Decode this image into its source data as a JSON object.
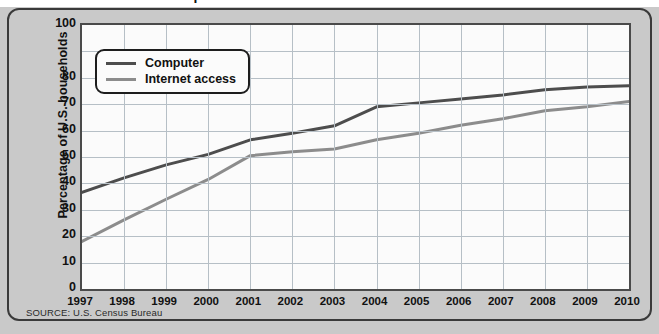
{
  "title_sliver": "Computer and Internet Access in U.S. Households",
  "axis": {
    "ylabel": "Percentage of U.S. households",
    "yticks": [
      {
        "value": 100,
        "label": "100"
      },
      {
        "value": 90,
        "label": ""
      },
      {
        "value": 80,
        "label": "80"
      },
      {
        "value": 70,
        "label": "70"
      },
      {
        "value": 60,
        "label": "60"
      },
      {
        "value": 50,
        "label": "50"
      },
      {
        "value": 40,
        "label": "40"
      },
      {
        "value": 30,
        "label": "30"
      },
      {
        "value": 20,
        "label": "20"
      },
      {
        "value": 10,
        "label": "10"
      },
      {
        "value": 0,
        "label": "0"
      }
    ],
    "xlabel": ""
  },
  "legend": {
    "position": "top-left-inside",
    "items": [
      {
        "label": "Computer",
        "color": "#4d4d4d"
      },
      {
        "label": "Internet access",
        "color": "#8c8c8c"
      }
    ]
  },
  "source": {
    "text": "SOURCE: U.S. Census Bureau"
  },
  "colors": {
    "background": "#c9c9c9",
    "plot_background": "#fbfbfb",
    "grid": "#b6bfc6",
    "frame": "#4a4a4a",
    "panel_border": "#3a3a3a",
    "computer": "#4d4d4d",
    "internet": "#8c8c8c",
    "text": "#111111"
  },
  "chart_data": {
    "type": "line",
    "title": "Computer and Internet Access in U.S. Households",
    "xlabel": "",
    "ylabel": "Percentage of U.S. households",
    "xlim": [
      1997,
      2010
    ],
    "ylim": [
      0,
      100
    ],
    "ytick_step": 10,
    "grid": true,
    "legend_position": "upper left",
    "x": [
      1997,
      1998,
      1999,
      2000,
      2001,
      2002,
      2003,
      2004,
      2005,
      2006,
      2007,
      2008,
      2009,
      2010
    ],
    "categories": [
      "1997",
      "1998",
      "1999",
      "2000",
      "2001",
      "2002",
      "2003",
      "2004",
      "2005",
      "2006",
      "2007",
      "2008",
      "2009",
      "2010"
    ],
    "series": [
      {
        "name": "Computer",
        "color": "#4d4d4d",
        "values": [
          36.6,
          42.1,
          47.0,
          51.0,
          56.5,
          59.0,
          61.8,
          69.0,
          70.5,
          72.0,
          73.5,
          75.5,
          76.5,
          77.0
        ]
      },
      {
        "name": "Internet access",
        "color": "#8c8c8c",
        "values": [
          18.0,
          26.2,
          34.0,
          41.5,
          50.5,
          52.0,
          53.0,
          56.5,
          59.0,
          62.0,
          64.5,
          67.5,
          69.0,
          71.0
        ]
      }
    ]
  }
}
